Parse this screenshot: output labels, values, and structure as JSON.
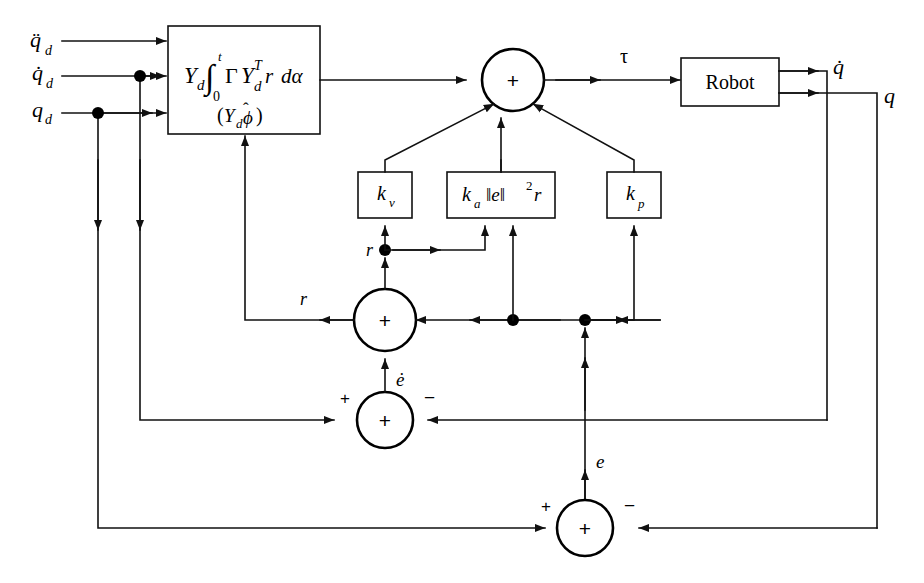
{
  "diagram": {
    "type": "control-block-diagram",
    "background_color": "#ffffff",
    "line_color": "#111111",
    "inputs": [
      {
        "id": "qdd",
        "label": "q̈",
        "subscript": "d",
        "accent": "double-dot",
        "description": "desired joint acceleration"
      },
      {
        "id": "qd_dot",
        "label": "q̇",
        "subscript": "d",
        "accent": "single-dot",
        "description": "desired joint velocity"
      },
      {
        "id": "qd",
        "label": "q",
        "subscript": "d",
        "accent": "none",
        "description": "desired joint position"
      }
    ],
    "blocks": [
      {
        "id": "adaptive-block",
        "name": "adaptive-feedforward-block",
        "formula_main": "Y_d ∫_0^t Γ Y_d^T r dα",
        "formula_sub": "(Y_d ϕ̂)",
        "parts": {
          "Yd": "Y",
          "Yd_sub": "d",
          "integral": "∫",
          "int_upper": "t",
          "int_lower": "0",
          "Gamma": "Γ",
          "YdT": "Y",
          "YdT_sub": "d",
          "YdT_sup": "T",
          "r": "r",
          "dalpha": "dα",
          "paren_open": "(",
          "paren_close": ")",
          "phi_hat": "ϕ",
          "hat": "ˆ"
        }
      },
      {
        "id": "kv",
        "name": "velocity-gain-block",
        "label": "k",
        "subscript": "v",
        "formula": "k_v"
      },
      {
        "id": "ka",
        "name": "adaptive-gain-block",
        "label": "k",
        "subscript": "a",
        "norm": "‖e‖",
        "exponent": "2",
        "trailing": "r",
        "formula": "k_a ‖e‖² r"
      },
      {
        "id": "kp",
        "name": "position-gain-block",
        "label": "k",
        "subscript": "p",
        "formula": "k_p"
      },
      {
        "id": "robot",
        "name": "robot-block",
        "label": "Robot"
      }
    ],
    "summers": [
      {
        "id": "sum-torque",
        "name": "torque-summing-junction",
        "inner": "+",
        "signs": []
      },
      {
        "id": "sum-r",
        "name": "r-summing-junction",
        "inner": "+",
        "signs": []
      },
      {
        "id": "sum-edot",
        "name": "velocity-error-summing-junction",
        "inner": "+",
        "signs": [
          "+",
          "−"
        ]
      },
      {
        "id": "sum-e",
        "name": "position-error-summing-junction",
        "inner": "+",
        "signs": [
          "+",
          "−"
        ]
      }
    ],
    "signals": [
      {
        "id": "tau",
        "label": "τ",
        "description": "control torque"
      },
      {
        "id": "qdot",
        "label": "q̇",
        "accent": "single-dot",
        "description": "measured joint velocity"
      },
      {
        "id": "q",
        "label": "q",
        "accent": "none",
        "description": "measured joint position"
      },
      {
        "id": "r1",
        "label": "r",
        "description": "filtered tracking error to gain blocks"
      },
      {
        "id": "r2",
        "label": "r",
        "description": "filtered tracking error to adaptive block"
      },
      {
        "id": "edot",
        "label": "ė",
        "accent": "single-dot",
        "description": "velocity tracking error"
      },
      {
        "id": "e",
        "label": "e",
        "description": "position tracking error"
      }
    ],
    "sign_labels": {
      "plus": "+",
      "minus": "−"
    }
  }
}
